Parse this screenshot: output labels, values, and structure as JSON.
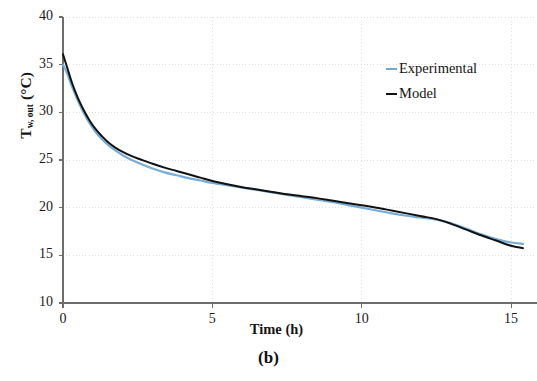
{
  "figure": {
    "panel_caption": "(b)"
  },
  "axes": {
    "y_title_main": "T",
    "y_title_sub": "w, out",
    "y_title_unit": " (°C)",
    "x_title": "Time (h)",
    "y_ticks": [
      "40",
      "35",
      "30",
      "25",
      "20",
      "15",
      "10"
    ],
    "x_ticks": [
      "0",
      "5",
      "10",
      "15"
    ]
  },
  "legend": {
    "items": [
      {
        "label": "Experimental",
        "color": "#6fa8d6"
      },
      {
        "label": "Model",
        "color": "#111111"
      }
    ]
  },
  "chart_data": {
    "type": "line",
    "title": "",
    "subtitle": "",
    "xlabel": "Time (h)",
    "ylabel": "T_w, out (°C)",
    "xlim": [
      0,
      15.4
    ],
    "ylim": [
      10,
      40
    ],
    "xticks": [
      0,
      5,
      10,
      15
    ],
    "yticks": [
      10,
      15,
      20,
      25,
      30,
      35,
      40
    ],
    "grid": true,
    "grid_color": "#d8d8d8",
    "legend_position": "upper-right-inside",
    "x": [
      0,
      0.15,
      0.3,
      0.5,
      0.7,
      0.9,
      1.1,
      1.3,
      1.5,
      1.75,
      2.0,
      2.3,
      2.6,
      3.0,
      3.4,
      3.8,
      4.2,
      4.6,
      5.0,
      5.5,
      6.0,
      6.5,
      7.0,
      7.5,
      8.0,
      8.5,
      9.0,
      9.5,
      10.0,
      10.5,
      11.0,
      11.5,
      12.0,
      12.5,
      13.0,
      13.5,
      14.0,
      14.5,
      15.0,
      15.4
    ],
    "series": [
      {
        "name": "Experimental",
        "color": "#6fa8d6",
        "values": [
          35.0,
          34.0,
          32.7,
          31.2,
          29.9,
          28.8,
          27.9,
          27.2,
          26.6,
          26.0,
          25.5,
          25.0,
          24.6,
          24.1,
          23.7,
          23.4,
          23.1,
          22.85,
          22.6,
          22.35,
          22.1,
          21.85,
          21.6,
          21.35,
          21.1,
          20.85,
          20.6,
          20.3,
          20.0,
          19.7,
          19.4,
          19.15,
          18.95,
          18.75,
          18.35,
          17.8,
          17.2,
          16.7,
          16.35,
          16.2
        ]
      },
      {
        "name": "Model",
        "color": "#111111",
        "values": [
          36.1,
          34.6,
          33.1,
          31.5,
          30.2,
          29.1,
          28.2,
          27.5,
          26.9,
          26.3,
          25.85,
          25.4,
          25.05,
          24.6,
          24.2,
          23.85,
          23.5,
          23.15,
          22.8,
          22.45,
          22.15,
          21.9,
          21.65,
          21.4,
          21.2,
          21.0,
          20.75,
          20.5,
          20.25,
          20.0,
          19.7,
          19.4,
          19.1,
          18.8,
          18.3,
          17.7,
          17.1,
          16.55,
          16.0,
          15.75
        ]
      }
    ]
  }
}
